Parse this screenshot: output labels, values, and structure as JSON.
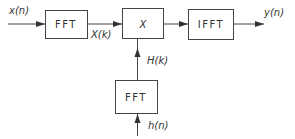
{
  "diagram": {
    "type": "block-diagram",
    "title": "",
    "blocks": [
      {
        "id": "fft1",
        "label": "FFT"
      },
      {
        "id": "mult",
        "label": "X"
      },
      {
        "id": "ifft",
        "label": "IFFT"
      },
      {
        "id": "fft2",
        "label": "FFT"
      }
    ],
    "signals": {
      "input": "x(n)",
      "spectrum": "X(k)",
      "filter_spectrum": "H(k)",
      "output": "y(n)",
      "impulse_response": "h(n)"
    },
    "edges": [
      {
        "from": "input",
        "to": "fft1",
        "label": "x(n)"
      },
      {
        "from": "fft1",
        "to": "mult",
        "label": "X(k)"
      },
      {
        "from": "mult",
        "to": "ifft",
        "label": ""
      },
      {
        "from": "ifft",
        "to": "output",
        "label": "y(n)"
      },
      {
        "from": "fft2",
        "to": "mult",
        "label": "H(k)"
      },
      {
        "from": "h_input",
        "to": "fft2",
        "label": "h(n)"
      }
    ]
  }
}
